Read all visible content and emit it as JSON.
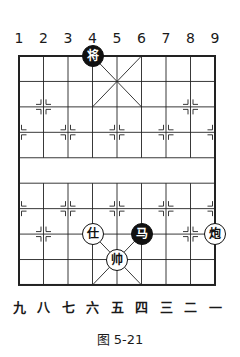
{
  "figure": {
    "caption": "图 5-21",
    "top_file_labels": [
      "1",
      "2",
      "3",
      "4",
      "5",
      "6",
      "7",
      "8",
      "9"
    ],
    "bottom_file_labels": [
      "九",
      "八",
      "七",
      "六",
      "五",
      "四",
      "三",
      "二",
      "一"
    ]
  },
  "board": {
    "columns": 9,
    "rows": 10,
    "origin_x": 19,
    "origin_y": 56,
    "col_step": 24.5,
    "row_step": 25.44,
    "line_color": "#222222",
    "river_text": ""
  },
  "pieces": [
    {
      "name": "black-general",
      "char": "将",
      "side": "black",
      "col": 3,
      "row": 0
    },
    {
      "name": "red-advisor",
      "char": "仕",
      "side": "red",
      "col": 3,
      "row": 7
    },
    {
      "name": "black-horse",
      "char": "马",
      "side": "black",
      "col": 5,
      "row": 7
    },
    {
      "name": "red-cannon",
      "char": "炮",
      "side": "red",
      "col": 8,
      "row": 7
    },
    {
      "name": "red-king",
      "char": "帅",
      "side": "red",
      "col": 4,
      "row": 8
    }
  ],
  "markers": [
    [
      1,
      2
    ],
    [
      7,
      2
    ],
    [
      0,
      3
    ],
    [
      2,
      3
    ],
    [
      4,
      3
    ],
    [
      6,
      3
    ],
    [
      8,
      3
    ],
    [
      0,
      6
    ],
    [
      2,
      6
    ],
    [
      4,
      6
    ],
    [
      6,
      6
    ],
    [
      8,
      6
    ],
    [
      1,
      7
    ],
    [
      7,
      7
    ]
  ]
}
